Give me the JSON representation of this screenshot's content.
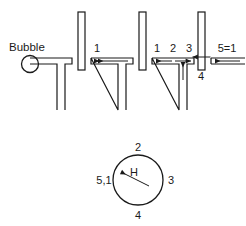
{
  "figure": {
    "title_text": "Bubble",
    "top_row": {
      "stages": [
        {
          "id": "stage-bubble",
          "labels": [],
          "bubble_label": "Bubble",
          "has_bubble": true
        },
        {
          "id": "stage-1",
          "labels": [
            "1"
          ],
          "has_bubble": false
        },
        {
          "id": "stage-123",
          "labels": [
            "1",
            "2",
            "3"
          ],
          "has_bubble": false
        },
        {
          "id": "stage-4",
          "labels": [
            "4"
          ],
          "has_bubble": false
        },
        {
          "id": "stage-5",
          "labels": [
            "5=1"
          ],
          "has_bubble": false
        }
      ]
    },
    "circle_diagram": {
      "labels": {
        "top": "2",
        "right": "3",
        "bottom": "4",
        "left": "5,1",
        "vector": "H"
      }
    },
    "colors": {
      "line": "#1a1a1a",
      "background": "#ffffff"
    }
  }
}
